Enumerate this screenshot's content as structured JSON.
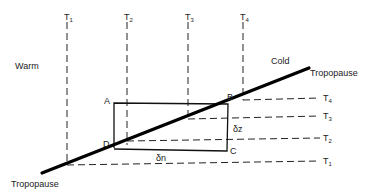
{
  "diagram": {
    "region_labels": {
      "warm": "Warm",
      "cold": "Cold"
    },
    "tropopause": {
      "label_upper": "Tropopause",
      "label_lower": "Tropopause"
    },
    "isotherms_vertical": [
      {
        "base": "T",
        "sub": "1"
      },
      {
        "base": "T",
        "sub": "2"
      },
      {
        "base": "T",
        "sub": "3"
      },
      {
        "base": "T",
        "sub": "4"
      }
    ],
    "isotherms_horizontal": [
      {
        "base": "T",
        "sub": "4"
      },
      {
        "base": "T",
        "sub": "3"
      },
      {
        "base": "T",
        "sub": "2"
      },
      {
        "base": "T",
        "sub": "1"
      }
    ],
    "box_corners": {
      "a": "A",
      "b": "B",
      "c": "C",
      "d": "D"
    },
    "increments": {
      "dz": "δz",
      "dn": "δn"
    },
    "colors": {
      "line": "#000000",
      "background": "#ffffff"
    }
  }
}
